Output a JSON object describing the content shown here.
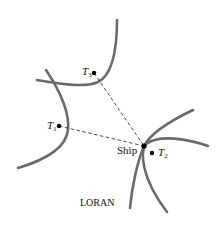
{
  "diagram": {
    "caption": "LORAN",
    "colors": {
      "curve": "#6b6b6b",
      "dashed_line": "#333333",
      "point": "#000000"
    },
    "points": [
      {
        "id": "T1",
        "label_main": "T",
        "label_sub": "1",
        "x": 59,
        "y": 126
      },
      {
        "id": "T2",
        "label_main": "T",
        "label_sub": "2",
        "x": 152,
        "y": 153
      },
      {
        "id": "T3",
        "label_main": "T",
        "label_sub": "3",
        "x": 94,
        "y": 73
      },
      {
        "id": "Ship",
        "label": "Ship",
        "x": 144,
        "y": 146
      }
    ],
    "lines": [
      {
        "from": "T1",
        "to": "Ship",
        "style": "dashed"
      },
      {
        "from": "T3",
        "to": "Ship",
        "style": "dashed"
      }
    ],
    "curves": [
      {
        "name": "hyperbola-branch-T3"
      },
      {
        "name": "hyperbola-branch-T1"
      },
      {
        "name": "hyperbola-branch-T2-upper"
      },
      {
        "name": "hyperbola-branch-T2-lower"
      }
    ]
  }
}
